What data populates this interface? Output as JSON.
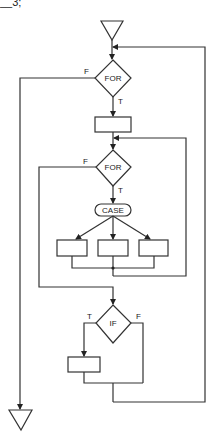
{
  "cropped_fragment": "__3;",
  "colors": {
    "stroke": "#333333",
    "background": "#ffffff"
  },
  "diagram": {
    "type": "structured-flowchart",
    "start_symbol": "triangle",
    "end_symbol": "triangle",
    "nodes": [
      {
        "id": "for1",
        "shape": "diamond",
        "label": "FOR"
      },
      {
        "id": "box1",
        "shape": "rectangle",
        "label": ""
      },
      {
        "id": "for2",
        "shape": "diamond",
        "label": "FOR"
      },
      {
        "id": "case",
        "shape": "rounded-pill",
        "label": "CASE"
      },
      {
        "id": "case_a",
        "shape": "rectangle",
        "label": ""
      },
      {
        "id": "case_b",
        "shape": "rectangle",
        "label": ""
      },
      {
        "id": "case_c",
        "shape": "rectangle",
        "label": ""
      },
      {
        "id": "if1",
        "shape": "diamond",
        "label": "IF"
      },
      {
        "id": "box_if",
        "shape": "rectangle",
        "label": ""
      }
    ],
    "edge_labels": {
      "for1_false": "F",
      "for1_true": "T",
      "for2_false": "F",
      "for2_true": "T",
      "if_true": "T",
      "if_false": "F"
    }
  }
}
